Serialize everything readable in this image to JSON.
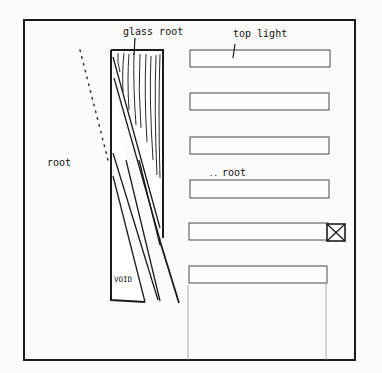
{
  "diagram": {
    "title": "",
    "labels": {
      "glass_roof": "glass root",
      "top_light": "top light",
      "roof_left": "root",
      "roof_right": "root",
      "roof_right_prefix": "..",
      "void": "VOID"
    },
    "elements": {
      "frame": {
        "x": 24,
        "y": 20,
        "width": 331,
        "height": 340
      },
      "void_column": {
        "x": 111,
        "y": 50,
        "width": 52,
        "height": 250
      },
      "skylight_bars": [
        {
          "index": 1,
          "x": 190,
          "y": 50,
          "width": 140,
          "height": 17
        },
        {
          "index": 2,
          "x": 190,
          "y": 93,
          "width": 139,
          "height": 17
        },
        {
          "index": 3,
          "x": 190,
          "y": 137,
          "width": 139,
          "height": 17
        },
        {
          "index": 4,
          "x": 190,
          "y": 180,
          "width": 139,
          "height": 18
        },
        {
          "index": 5,
          "x": 189,
          "y": 223,
          "width": 139,
          "height": 17
        },
        {
          "index": 6,
          "x": 189,
          "y": 266,
          "width": 138,
          "height": 17
        }
      ],
      "x_box": {
        "x": 327,
        "y": 224,
        "width": 18,
        "height": 17
      }
    },
    "colors": {
      "ink": "#1c1c1c",
      "paper": "#fbfbf9",
      "faint_line": "#9a9a9a"
    }
  }
}
